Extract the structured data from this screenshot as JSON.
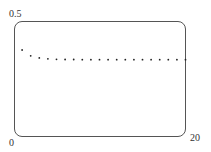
{
  "chart_data": {
    "type": "scatter",
    "title": "",
    "xlabel": "",
    "ylabel": "",
    "xlim": [
      0,
      20
    ],
    "ylim": [
      0,
      0.5
    ],
    "grid": false,
    "legend": null,
    "tick_labels": {
      "y_top": "0.5",
      "origin": "0",
      "x_right": "20"
    },
    "x": [
      1,
      2,
      3,
      4,
      5,
      6,
      7,
      8,
      9,
      10,
      11,
      12,
      13,
      14,
      15,
      16,
      17,
      18,
      19,
      20
    ],
    "values": [
      0.375,
      0.35,
      0.341,
      0.337,
      0.335,
      0.334,
      0.334,
      0.3335,
      0.3335,
      0.3334,
      0.3334,
      0.3334,
      0.3333,
      0.3333,
      0.3333,
      0.3333,
      0.3333,
      0.3333,
      0.3333,
      0.3333
    ],
    "colors": {
      "points": "#222222",
      "frame": "#555555"
    }
  }
}
